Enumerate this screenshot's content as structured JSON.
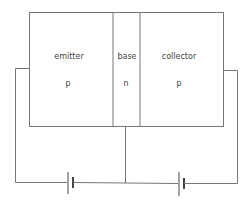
{
  "diagram": {
    "regions": [
      {
        "name": "emitter",
        "label": "emitter",
        "type": "p"
      },
      {
        "name": "base",
        "label": "base",
        "type": "n"
      },
      {
        "name": "collector",
        "label": "collector",
        "type": "p"
      }
    ],
    "batteries": [
      {
        "name": "emitter-base-battery"
      },
      {
        "name": "collector-base-battery"
      }
    ],
    "colors": {
      "line": "#777777",
      "text": "#444444",
      "background": "#ffffff"
    }
  }
}
